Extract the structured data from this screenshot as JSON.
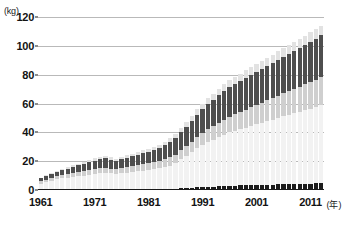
{
  "chart_data": {
    "type": "bar",
    "stacked": true,
    "title": "",
    "subtitle": "",
    "xlabel": "年",
    "ylabel": "",
    "yunit": "(kg)",
    "xunit": "(年)",
    "ylim": [
      0,
      120
    ],
    "yticks": [
      0,
      20,
      40,
      60,
      80,
      100,
      120
    ],
    "xticks": [
      1961,
      1971,
      1981,
      1991,
      2001,
      2011
    ],
    "grid": true,
    "legend": "none",
    "categories": [
      1961,
      1962,
      1963,
      1964,
      1965,
      1966,
      1967,
      1968,
      1969,
      1970,
      1971,
      1972,
      1973,
      1974,
      1975,
      1976,
      1977,
      1978,
      1979,
      1980,
      1981,
      1982,
      1983,
      1984,
      1985,
      1986,
      1987,
      1988,
      1989,
      1990,
      1991,
      1992,
      1993,
      1994,
      1995,
      1996,
      1997,
      1998,
      1999,
      2000,
      2001,
      2002,
      2003,
      2004,
      2005,
      2006,
      2007,
      2008,
      2009,
      2010,
      2011,
      2012,
      2013
    ],
    "series": [
      {
        "name": "series-1",
        "color": "#1c1c1c",
        "values": [
          0,
          0,
          0,
          0,
          0,
          0,
          0,
          0,
          0,
          0,
          0,
          0,
          0,
          0,
          0,
          0,
          0,
          0,
          0,
          0,
          0,
          0,
          0,
          0,
          0,
          0,
          1.2,
          1.4,
          1.6,
          1.8,
          2.0,
          2.2,
          2.4,
          2.6,
          2.8,
          3.0,
          3.1,
          3.2,
          3.3,
          3.4,
          3.5,
          3.6,
          3.7,
          3.8,
          3.9,
          4.0,
          4.1,
          4.2,
          4.3,
          4.4,
          4.5,
          4.6,
          4.7
        ]
      },
      {
        "name": "series-2",
        "color": "#f2f2f2",
        "values": [
          4.5,
          5.5,
          6.5,
          7.5,
          8.0,
          8.5,
          9.0,
          9.5,
          10.0,
          10.5,
          11.0,
          11.5,
          12.0,
          11.5,
          11.0,
          11.5,
          12.0,
          12.5,
          13.0,
          13.5,
          14.0,
          14.5,
          15.0,
          16.0,
          17.0,
          18.5,
          20.0,
          22.0,
          24.5,
          27.0,
          29.0,
          31.0,
          32.5,
          34.0,
          35.5,
          37.0,
          38.0,
          39.0,
          40.0,
          41.0,
          42.0,
          43.0,
          44.0,
          45.0,
          46.0,
          47.0,
          48.0,
          49.0,
          50.0,
          51.0,
          52.0,
          53.0,
          54.0
        ]
      },
      {
        "name": "series-3",
        "color": "#cfcfcf",
        "values": [
          1.5,
          1.6,
          1.8,
          2.0,
          2.2,
          2.4,
          2.6,
          2.8,
          3.0,
          3.2,
          3.4,
          3.5,
          3.6,
          3.4,
          3.3,
          3.5,
          3.7,
          3.9,
          4.1,
          4.3,
          4.5,
          4.7,
          5.0,
          5.3,
          5.6,
          6.0,
          6.5,
          7.0,
          7.5,
          8.0,
          8.5,
          9.0,
          9.5,
          10.0,
          10.5,
          11.0,
          11.5,
          12.0,
          12.5,
          13.0,
          13.5,
          14.0,
          14.5,
          15.0,
          15.5,
          16.0,
          16.5,
          17.0,
          17.5,
          18.0,
          18.5,
          19.0,
          19.5
        ]
      },
      {
        "name": "series-4",
        "color": "#4e4e4e",
        "values": [
          2.0,
          2.4,
          2.8,
          3.2,
          3.6,
          4.0,
          4.4,
          4.8,
          5.2,
          5.6,
          6.0,
          6.3,
          6.6,
          6.2,
          6.0,
          6.3,
          6.6,
          7.0,
          7.4,
          7.8,
          8.2,
          8.6,
          9.2,
          9.8,
          10.6,
          11.5,
          12.5,
          13.5,
          14.5,
          15.5,
          16.5,
          17.5,
          18.2,
          19.0,
          19.8,
          20.5,
          21.0,
          21.5,
          22.0,
          22.5,
          23.0,
          23.5,
          24.0,
          24.5,
          25.0,
          25.5,
          26.0,
          26.5,
          27.0,
          27.5,
          28.0,
          28.5,
          29.0
        ]
      },
      {
        "name": "series-5",
        "color": "#e2e2e2",
        "values": [
          0.5,
          0.6,
          0.7,
          0.8,
          0.9,
          1.0,
          1.1,
          1.2,
          1.3,
          1.4,
          1.5,
          1.6,
          1.7,
          1.6,
          1.5,
          1.6,
          1.7,
          1.8,
          1.9,
          2.0,
          2.1,
          2.2,
          2.3,
          2.5,
          2.7,
          2.9,
          3.1,
          3.3,
          3.5,
          3.7,
          3.9,
          4.1,
          4.3,
          4.5,
          4.7,
          4.9,
          5.0,
          5.1,
          5.2,
          5.3,
          5.4,
          5.5,
          5.6,
          5.7,
          5.8,
          5.9,
          6.0,
          6.1,
          6.2,
          6.3,
          6.4,
          6.5,
          6.6
        ]
      }
    ],
    "totals": [
      8.5,
      10.1,
      11.8,
      13.5,
      14.7,
      15.9,
      17.1,
      18.3,
      19.5,
      20.7,
      21.9,
      22.9,
      23.9,
      22.7,
      21.8,
      22.9,
      24.0,
      25.2,
      26.4,
      27.6,
      28.8,
      30.0,
      31.5,
      33.6,
      35.9,
      38.9,
      43.3,
      47.2,
      51.6,
      56.0,
      59.9,
      63.8,
      66.9,
      70.1,
      73.3,
      76.4,
      78.6,
      80.8,
      83.0,
      85.2,
      87.4,
      89.6,
      91.8,
      94.0,
      96.2,
      98.4,
      100.6,
      102.8,
      105.0,
      107.2,
      109.4,
      111.6,
      113.8
    ]
  },
  "axis": {
    "y_unit_label": "(kg)",
    "x_unit_label": "(年)",
    "y_labels": [
      "120",
      "100",
      "80",
      "60",
      "40",
      "20",
      "0"
    ],
    "x_labels": [
      "1961",
      "1971",
      "1981",
      "1991",
      "2001",
      "2011"
    ]
  }
}
